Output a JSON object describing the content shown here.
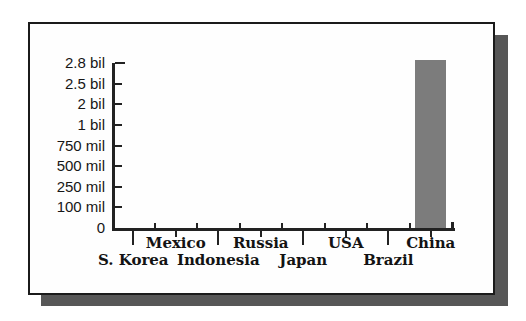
{
  "chart_data": {
    "type": "bar",
    "title": "",
    "categories": [
      "S. Korea",
      "Mexico",
      "Indonesia",
      "Russia",
      "Japan",
      "USA",
      "Brazil",
      "China"
    ],
    "values": [
      0,
      0,
      0,
      0,
      0,
      0,
      0,
      2850000000
    ],
    "y_tick_labels": [
      "2.8 bil",
      "2.5 bil",
      "2 bil",
      "1 bil",
      "750 mil",
      "500 mil",
      "250 mil",
      "100 mil",
      "0"
    ],
    "y_tick_values": [
      2800000000,
      2500000000,
      2000000000,
      1000000000,
      750000000,
      500000000,
      250000000,
      100000000,
      0
    ],
    "y_scale_note": "tick marks evenly spaced despite non-linear values; China bar extends slightly above the 2.8 bil tick",
    "bar_color": "#7c7c7c",
    "axis_color": "#222222",
    "grid": false,
    "legend": "none"
  },
  "panel": {
    "background": "#fefefe",
    "border_color": "#1b1b1b",
    "shadow_color": "#575757"
  }
}
